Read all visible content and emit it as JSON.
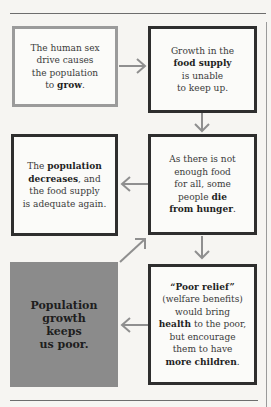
{
  "diagram": {
    "boxes": [
      {
        "id": "sex-drive",
        "parts": [
          {
            "t": "The human sex drive causes the population to "
          },
          {
            "t": "grow",
            "b": true
          },
          {
            "t": "."
          }
        ]
      },
      {
        "id": "food-supply",
        "parts": [
          {
            "t": "Growth in the "
          },
          {
            "t": "food supply",
            "b": true
          },
          {
            "t": " is unable to keep up."
          }
        ]
      },
      {
        "id": "population-decreases",
        "parts": [
          {
            "t": "The "
          },
          {
            "t": "population decreases",
            "b": true
          },
          {
            "t": ", and the food supply is adequate again."
          }
        ]
      },
      {
        "id": "die-from-hunger",
        "parts": [
          {
            "t": "As there is not enough food for all, some people "
          },
          {
            "t": "die from hunger",
            "b": true
          },
          {
            "t": "."
          }
        ]
      },
      {
        "id": "conclusion",
        "parts": [
          {
            "t": "Population growth keeps us poor.",
            "b": true
          }
        ]
      },
      {
        "id": "poor-relief",
        "parts": [
          {
            "t": "“Poor relief”",
            "b": true
          },
          {
            "t": " (welfare benefits) would bring "
          },
          {
            "t": "health",
            "b": true
          },
          {
            "t": " to the poor, but encourage them to have "
          },
          {
            "t": "more children",
            "b": true
          },
          {
            "t": "."
          }
        ]
      }
    ],
    "lines": {
      "sex-drive": [
        "The human sex",
        "drive causes",
        "the population",
        "to |grow|."
      ],
      "food-supply": [
        "Growth in the",
        "|food supply|",
        "is unable",
        "to keep up."
      ],
      "population-decreases": [
        "The |population|",
        "|decreases|, and",
        "the food supply",
        "is adequate again."
      ],
      "die-from-hunger": [
        "As there is not",
        "enough food",
        "for all, some",
        "people |die|",
        "|from hunger|."
      ],
      "conclusion": [
        "Population",
        "growth",
        "keeps",
        "us poor."
      ],
      "poor-relief": [
        "|“Poor relief”|",
        "(welfare benefits)",
        "would bring",
        "|health| to the poor,",
        "but encourage",
        "them to have",
        "|more children|."
      ]
    },
    "colors": {
      "background": "#f6f5f2",
      "light_border": "#9b9b9b",
      "dark_border": "#2e2e2e",
      "fill_box": "#8b8b8b",
      "arrow": "#8f8f8f"
    }
  }
}
